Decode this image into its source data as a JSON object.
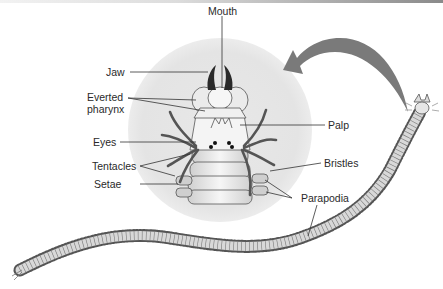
{
  "diagram": {
    "labels": {
      "mouth": "Mouth",
      "jaw": "Jaw",
      "everted_pharynx_line1": "Everted",
      "everted_pharynx_line2": "pharynx",
      "eyes": "Eyes",
      "palp": "Palp",
      "tentacles": "Tentacles",
      "setae": "Setae",
      "bristles": "Bristles",
      "parapodia": "Parapodia"
    },
    "colors": {
      "background": "#ffffff",
      "halo": "#e6e6e6",
      "arrow": "#7a7a7a",
      "body_fill": "#d6d6d6",
      "outline": "#3a3a3a",
      "jaw": "#2a2a2a",
      "tentacle": "#555555",
      "text": "#2a2a2a"
    }
  }
}
